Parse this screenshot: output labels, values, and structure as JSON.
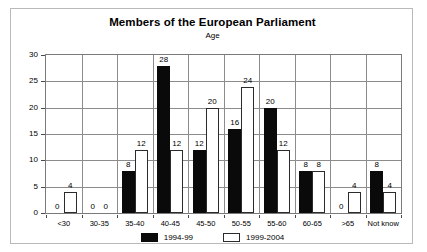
{
  "chart_data": {
    "type": "bar",
    "title": "Members of the European Parliament",
    "subtitle": "Age",
    "xlabel": "",
    "ylabel": "",
    "ylim": [
      0,
      30
    ],
    "yticks": [
      0,
      5,
      10,
      15,
      20,
      25,
      30
    ],
    "grid": true,
    "legend_position": "bottom",
    "categories": [
      "<30",
      "30-35",
      "35-40",
      "40-45",
      "45-50",
      "50-55",
      "55-60",
      "60-65",
      ">65",
      "Not know"
    ],
    "series": [
      {
        "name": "1994-99",
        "color": "#0a0a0a",
        "values": [
          0,
          0,
          8,
          28,
          12,
          16,
          20,
          8,
          0,
          8
        ]
      },
      {
        "name": "1999-2004",
        "color": "#ffffff",
        "values": [
          4,
          0,
          12,
          12,
          20,
          24,
          12,
          8,
          4,
          4
        ]
      }
    ]
  }
}
